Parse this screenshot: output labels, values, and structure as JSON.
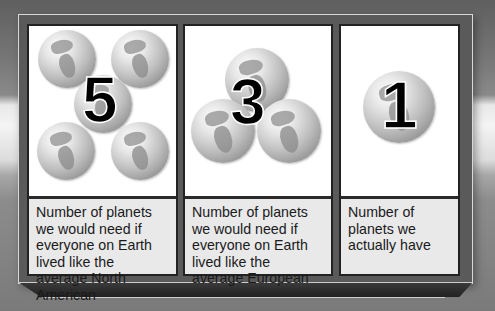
{
  "panels": [
    {
      "number": "5",
      "globe_count": 5,
      "caption": "Number of planets we would need if everyone on Earth lived like the average North American"
    },
    {
      "number": "3",
      "globe_count": 3,
      "caption": "Number of planets we would need if everyone on Earth lived like the average European"
    },
    {
      "number": "1",
      "globe_count": 1,
      "caption": "Number of planets we actually have"
    }
  ],
  "icons": {
    "globe": "globe-icon"
  },
  "colors": {
    "frame": "#5a5a5a",
    "caption_bg": "#e9e9ea",
    "number": "#000000",
    "globe_light": "#e6e6e6",
    "globe_dark": "#8d8d8d"
  }
}
